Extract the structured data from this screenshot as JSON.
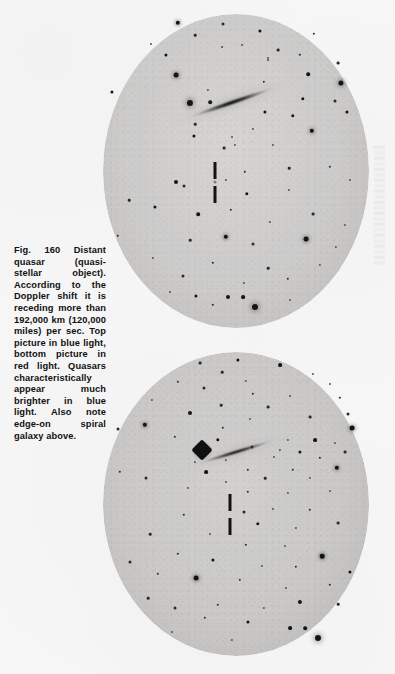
{
  "page": {
    "background_color": "#f6f6f6",
    "width": 395,
    "height": 674
  },
  "caption": {
    "figure_number": "Fig. 160",
    "text": "Fig. 160 Distant quasar (quasi-stellar object). According to the Doppler shift it is receding more than 192,000 km (120,000 miles) per sec. Top picture in blue light, bottom picture in red light. Quasars characteristically appear much brighter in blue light. Also note edge-on spiral galaxy above.",
    "body": "Fig. 160 Distant quasar (quasi-stellar object). According to the Doppler shift it is receding more than 192,000 km (120,000 miles) per sec. Top picture in blue light, bottom picture in red light. Quasars characteristically appear much brighter in blue light. Also note edge-on",
    "last_line": "spiral galaxy above.",
    "recession_speed_km": "192,000 km",
    "recession_speed_miles": "120,000 miles",
    "text_color": "#111111"
  },
  "plates": [
    {
      "id": "plate-top",
      "label": "Top picture in blue light",
      "filter": "blue light",
      "emulsion_color": "#cdcccb",
      "features": [
        "edge-on spiral galaxy",
        "quasar tick marks",
        "bright star"
      ]
    },
    {
      "id": "plate-bottom",
      "label": "Bottom picture in red light",
      "filter": "red light",
      "emulsion_color": "#cac9c8",
      "features": [
        "edge-on spiral galaxy",
        "quasar tick marks",
        "bright star with diffraction spikes"
      ]
    }
  ],
  "chart_data": {
    "type": "scatter",
    "title": "Fig. 160 Distant quasar (quasi-stellar object)",
    "xlabel": "",
    "ylabel": "",
    "series": [
      {
        "name": "plate-top-blue-light",
        "note": "Star field on blue-light photographic plate; x,y in page pixels, r = star radius px",
        "values": [
          {
            "x": 178,
            "y": 23,
            "r": 2.2
          },
          {
            "x": 223,
            "y": 24,
            "r": 1.5
          },
          {
            "x": 195,
            "y": 35,
            "r": 1.3
          },
          {
            "x": 260,
            "y": 31,
            "r": 1.6
          },
          {
            "x": 314,
            "y": 34,
            "r": 1.2
          },
          {
            "x": 151,
            "y": 44,
            "r": 1.1
          },
          {
            "x": 242,
            "y": 45,
            "r": 1.0
          },
          {
            "x": 278,
            "y": 50,
            "r": 1.4
          },
          {
            "x": 166,
            "y": 55,
            "r": 1.6
          },
          {
            "x": 300,
            "y": 55,
            "r": 1.2
          },
          {
            "x": 222,
            "y": 47,
            "r": 0.9
          },
          {
            "x": 268,
            "y": 58,
            "r": 1.0
          },
          {
            "x": 338,
            "y": 63,
            "r": 1.4
          },
          {
            "x": 176,
            "y": 75,
            "r": 2.4
          },
          {
            "x": 268,
            "y": 60,
            "r": 0.9
          },
          {
            "x": 112,
            "y": 92,
            "r": 1.6
          },
          {
            "x": 308,
            "y": 74,
            "r": 1.8
          },
          {
            "x": 341,
            "y": 83,
            "r": 2.6
          },
          {
            "x": 208,
            "y": 90,
            "r": 1.1
          },
          {
            "x": 190,
            "y": 103,
            "r": 3.1
          },
          {
            "x": 210,
            "y": 102,
            "r": 1.8
          },
          {
            "x": 264,
            "y": 82,
            "r": 1.2
          },
          {
            "x": 303,
            "y": 99,
            "r": 1.7
          },
          {
            "x": 335,
            "y": 101,
            "r": 1.5
          },
          {
            "x": 265,
            "y": 112,
            "r": 1.6
          },
          {
            "x": 293,
            "y": 116,
            "r": 1.7
          },
          {
            "x": 347,
            "y": 112,
            "r": 1.6
          },
          {
            "x": 195,
            "y": 124,
            "r": 1.3
          },
          {
            "x": 253,
            "y": 129,
            "r": 1.1
          },
          {
            "x": 312,
            "y": 131,
            "r": 2.2
          },
          {
            "x": 194,
            "y": 136,
            "r": 1.6
          },
          {
            "x": 232,
            "y": 137,
            "r": 1.0
          },
          {
            "x": 235,
            "y": 145,
            "r": 1.1
          },
          {
            "x": 224,
            "y": 148,
            "r": 1.4
          },
          {
            "x": 273,
            "y": 145,
            "r": 1.1
          },
          {
            "x": 176,
            "y": 182,
            "r": 2.0
          },
          {
            "x": 184,
            "y": 186,
            "r": 1.5
          },
          {
            "x": 245,
            "y": 172,
            "r": 1.2
          },
          {
            "x": 226,
            "y": 180,
            "r": 1.1
          },
          {
            "x": 289,
            "y": 168,
            "r": 1.3
          },
          {
            "x": 330,
            "y": 167,
            "r": 1.2
          },
          {
            "x": 350,
            "y": 180,
            "r": 1.1
          },
          {
            "x": 289,
            "y": 190,
            "r": 1.1
          },
          {
            "x": 247,
            "y": 194,
            "r": 1.7
          },
          {
            "x": 129,
            "y": 200,
            "r": 1.3
          },
          {
            "x": 155,
            "y": 207,
            "r": 1.6
          },
          {
            "x": 198,
            "y": 214,
            "r": 1.8
          },
          {
            "x": 231,
            "y": 210,
            "r": 1.2
          },
          {
            "x": 270,
            "y": 222,
            "r": 1.1
          },
          {
            "x": 313,
            "y": 214,
            "r": 1.4
          },
          {
            "x": 345,
            "y": 225,
            "r": 1.0
          },
          {
            "x": 118,
            "y": 236,
            "r": 1.2
          },
          {
            "x": 190,
            "y": 240,
            "r": 1.3
          },
          {
            "x": 226,
            "y": 237,
            "r": 2.2
          },
          {
            "x": 253,
            "y": 244,
            "r": 1.5
          },
          {
            "x": 306,
            "y": 239,
            "r": 2.4
          },
          {
            "x": 336,
            "y": 247,
            "r": 1.1
          },
          {
            "x": 153,
            "y": 258,
            "r": 1.1
          },
          {
            "x": 213,
            "y": 263,
            "r": 1.2
          },
          {
            "x": 268,
            "y": 268,
            "r": 1.3
          },
          {
            "x": 320,
            "y": 265,
            "r": 1.1
          },
          {
            "x": 183,
            "y": 276,
            "r": 1.5
          },
          {
            "x": 244,
            "y": 283,
            "r": 1.1
          },
          {
            "x": 288,
            "y": 279,
            "r": 1.2
          },
          {
            "x": 170,
            "y": 292,
            "r": 1.1
          },
          {
            "x": 196,
            "y": 296,
            "r": 1.6
          },
          {
            "x": 228,
            "y": 297,
            "r": 2.0
          },
          {
            "x": 243,
            "y": 297,
            "r": 1.9
          },
          {
            "x": 255,
            "y": 307,
            "r": 3.0
          },
          {
            "x": 213,
            "y": 305,
            "r": 1.2
          },
          {
            "x": 290,
            "y": 300,
            "r": 1.1
          }
        ]
      },
      {
        "name": "plate-bottom-red-light",
        "note": "Star field on red-light photographic plate; quasar much fainter here",
        "values": [
          {
            "x": 200,
            "y": 363,
            "r": 1.4
          },
          {
            "x": 238,
            "y": 360,
            "r": 1.6
          },
          {
            "x": 222,
            "y": 372,
            "r": 1.3
          },
          {
            "x": 280,
            "y": 365,
            "r": 1.9
          },
          {
            "x": 246,
            "y": 381,
            "r": 1.1
          },
          {
            "x": 313,
            "y": 374,
            "r": 1.1
          },
          {
            "x": 178,
            "y": 382,
            "r": 1.2
          },
          {
            "x": 204,
            "y": 388,
            "r": 1.5
          },
          {
            "x": 253,
            "y": 394,
            "r": 1.2
          },
          {
            "x": 330,
            "y": 384,
            "r": 1.0
          },
          {
            "x": 290,
            "y": 396,
            "r": 1.0
          },
          {
            "x": 152,
            "y": 400,
            "r": 1.1
          },
          {
            "x": 221,
            "y": 405,
            "r": 1.3
          },
          {
            "x": 268,
            "y": 407,
            "r": 1.4
          },
          {
            "x": 340,
            "y": 398,
            "r": 1.2
          },
          {
            "x": 190,
            "y": 413,
            "r": 2.0
          },
          {
            "x": 250,
            "y": 419,
            "r": 1.1
          },
          {
            "x": 310,
            "y": 417,
            "r": 1.4
          },
          {
            "x": 348,
            "y": 414,
            "r": 1.5
          },
          {
            "x": 118,
            "y": 429,
            "r": 1.5
          },
          {
            "x": 145,
            "y": 425,
            "r": 2.2
          },
          {
            "x": 223,
            "y": 428,
            "r": 1.2
          },
          {
            "x": 352,
            "y": 428,
            "r": 2.4
          },
          {
            "x": 175,
            "y": 437,
            "r": 1.2
          },
          {
            "x": 218,
            "y": 440,
            "r": 1.7
          },
          {
            "x": 288,
            "y": 440,
            "r": 1.1
          },
          {
            "x": 315,
            "y": 440,
            "r": 1.9
          },
          {
            "x": 335,
            "y": 443,
            "r": 1.1
          },
          {
            "x": 252,
            "y": 447,
            "r": 1.5
          },
          {
            "x": 280,
            "y": 450,
            "r": 1.1
          },
          {
            "x": 300,
            "y": 452,
            "r": 1.6
          },
          {
            "x": 345,
            "y": 452,
            "r": 1.4
          },
          {
            "x": 195,
            "y": 462,
            "r": 1.1
          },
          {
            "x": 226,
            "y": 460,
            "r": 1.1
          },
          {
            "x": 274,
            "y": 457,
            "r": 1.0
          },
          {
            "x": 320,
            "y": 458,
            "r": 1.2
          },
          {
            "x": 248,
            "y": 470,
            "r": 1.2
          },
          {
            "x": 206,
            "y": 472,
            "r": 1.9
          },
          {
            "x": 293,
            "y": 470,
            "r": 1.2
          },
          {
            "x": 337,
            "y": 468,
            "r": 2.2
          },
          {
            "x": 120,
            "y": 472,
            "r": 1.2
          },
          {
            "x": 146,
            "y": 478,
            "r": 1.5
          },
          {
            "x": 265,
            "y": 478,
            "r": 1.3
          },
          {
            "x": 310,
            "y": 478,
            "r": 1.1
          },
          {
            "x": 226,
            "y": 482,
            "r": 1.0
          },
          {
            "x": 188,
            "y": 488,
            "r": 1.1
          },
          {
            "x": 248,
            "y": 492,
            "r": 1.2
          },
          {
            "x": 288,
            "y": 493,
            "r": 1.1
          },
          {
            "x": 330,
            "y": 491,
            "r": 1.0
          },
          {
            "x": 244,
            "y": 512,
            "r": 1.5
          },
          {
            "x": 273,
            "y": 509,
            "r": 1.1
          },
          {
            "x": 310,
            "y": 510,
            "r": 1.2
          },
          {
            "x": 184,
            "y": 515,
            "r": 1.2
          },
          {
            "x": 258,
            "y": 524,
            "r": 1.7
          },
          {
            "x": 296,
            "y": 528,
            "r": 1.1
          },
          {
            "x": 338,
            "y": 523,
            "r": 1.4
          },
          {
            "x": 210,
            "y": 534,
            "r": 1.1
          },
          {
            "x": 150,
            "y": 534,
            "r": 1.3
          },
          {
            "x": 246,
            "y": 545,
            "r": 1.2
          },
          {
            "x": 285,
            "y": 546,
            "r": 1.1
          },
          {
            "x": 322,
            "y": 556,
            "r": 2.3
          },
          {
            "x": 178,
            "y": 554,
            "r": 1.2
          },
          {
            "x": 213,
            "y": 560,
            "r": 1.6
          },
          {
            "x": 262,
            "y": 566,
            "r": 1.1
          },
          {
            "x": 296,
            "y": 567,
            "r": 1.2
          },
          {
            "x": 130,
            "y": 562,
            "r": 1.5
          },
          {
            "x": 158,
            "y": 574,
            "r": 1.2
          },
          {
            "x": 196,
            "y": 578,
            "r": 2.4
          },
          {
            "x": 240,
            "y": 580,
            "r": 1.2
          },
          {
            "x": 286,
            "y": 588,
            "r": 1.1
          },
          {
            "x": 330,
            "y": 585,
            "r": 1.2
          },
          {
            "x": 350,
            "y": 572,
            "r": 1.6
          },
          {
            "x": 148,
            "y": 598,
            "r": 1.3
          },
          {
            "x": 175,
            "y": 608,
            "r": 1.5
          },
          {
            "x": 218,
            "y": 605,
            "r": 1.2
          },
          {
            "x": 264,
            "y": 608,
            "r": 1.1
          },
          {
            "x": 300,
            "y": 602,
            "r": 2.1
          },
          {
            "x": 338,
            "y": 604,
            "r": 1.3
          },
          {
            "x": 205,
            "y": 618,
            "r": 1.2
          },
          {
            "x": 248,
            "y": 622,
            "r": 1.6
          },
          {
            "x": 290,
            "y": 628,
            "r": 1.9
          },
          {
            "x": 305,
            "y": 628,
            "r": 1.8
          },
          {
            "x": 318,
            "y": 638,
            "r": 3.0
          },
          {
            "x": 172,
            "y": 632,
            "r": 1.1
          },
          {
            "x": 232,
            "y": 640,
            "r": 1.1
          }
        ]
      }
    ],
    "annotations": [
      {
        "label": "edge-on spiral galaxy",
        "plate": "top",
        "x": 232,
        "y": 106
      },
      {
        "label": "edge-on spiral galaxy",
        "plate": "bottom",
        "x": 236,
        "y": 452
      },
      {
        "label": "quasar tick marks",
        "plate": "top",
        "x": 215,
        "y": 180
      },
      {
        "label": "quasar tick marks",
        "plate": "bottom",
        "x": 230,
        "y": 515
      },
      {
        "label": "bright star",
        "plate": "top",
        "x": 190,
        "y": 103
      },
      {
        "label": "bright star with diffraction spikes",
        "plate": "bottom",
        "x": 202,
        "y": 450
      }
    ]
  }
}
